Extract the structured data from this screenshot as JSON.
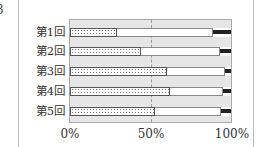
{
  "figure_number": "3",
  "chart_data": {
    "type": "bar",
    "orientation": "horizontal",
    "stacked": true,
    "percent": true,
    "categories": [
      "第1回",
      "第2回",
      "第3回",
      "第4回",
      "第5回"
    ],
    "series": [
      {
        "name": "dotted",
        "pattern": "dots",
        "values": [
          29,
          44,
          60,
          62,
          53
        ]
      },
      {
        "name": "white",
        "pattern": "blank",
        "values": [
          60,
          49,
          36,
          33,
          41
        ]
      },
      {
        "name": "black",
        "pattern": "solid-black",
        "values": [
          11,
          7,
          4,
          5,
          6
        ]
      }
    ],
    "x_ticks": [
      "0%",
      "50%",
      "100%"
    ],
    "xlim": [
      0,
      100
    ],
    "reference_line": {
      "x": 50,
      "style": "dashed"
    },
    "title": "",
    "xlabel": "",
    "ylabel": "",
    "legend": null
  }
}
